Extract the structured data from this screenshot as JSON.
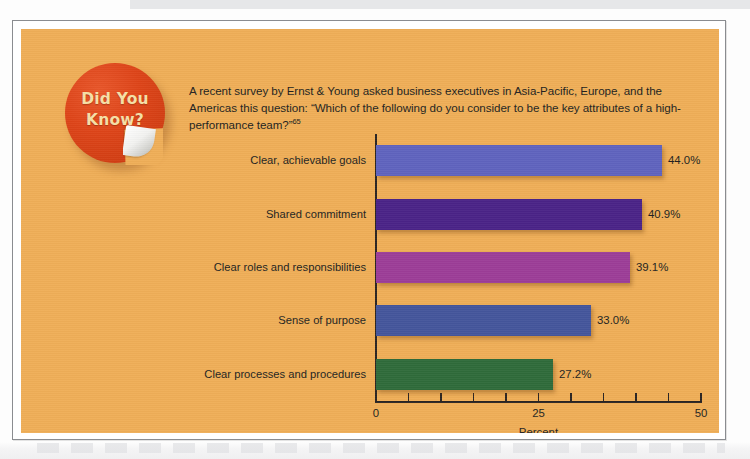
{
  "sticker": {
    "line1": "Did You",
    "line2": "Know?",
    "bg_color": "#dd4418",
    "text_color": "#f6dfa6"
  },
  "intro": {
    "text": "A recent survey by Ernst & Young asked business executives in Asia-Pacific, Europe, and the Americas this question: “Which of the following do you consider to be the key attributes of a high-performance team?”",
    "footnote_marker": "65"
  },
  "panel": {
    "bg_color": "#efae57"
  },
  "chart_data": {
    "type": "bar",
    "orientation": "horizontal",
    "title": "",
    "xlabel": "Percent",
    "ylabel": "",
    "xlim": [
      0,
      50
    ],
    "xticks": [
      0,
      25,
      50
    ],
    "xtick_labels": [
      "0",
      "25",
      "50"
    ],
    "minor_tick_step": 5,
    "grid": false,
    "legend": "none",
    "categories": [
      "Clear, achievable goals",
      "Shared commitment",
      "Clear roles and responsibilities",
      "Sense of purpose",
      "Clear processes and procedures"
    ],
    "values": [
      44.0,
      40.9,
      39.1,
      33.0,
      27.2
    ],
    "value_labels": [
      "44.0%",
      "40.9%",
      "39.1%",
      "33.0%",
      "27.2%"
    ],
    "colors": [
      "#5f63be",
      "#4a2387",
      "#9c3d97",
      "#44559b",
      "#2f6b3a"
    ]
  }
}
